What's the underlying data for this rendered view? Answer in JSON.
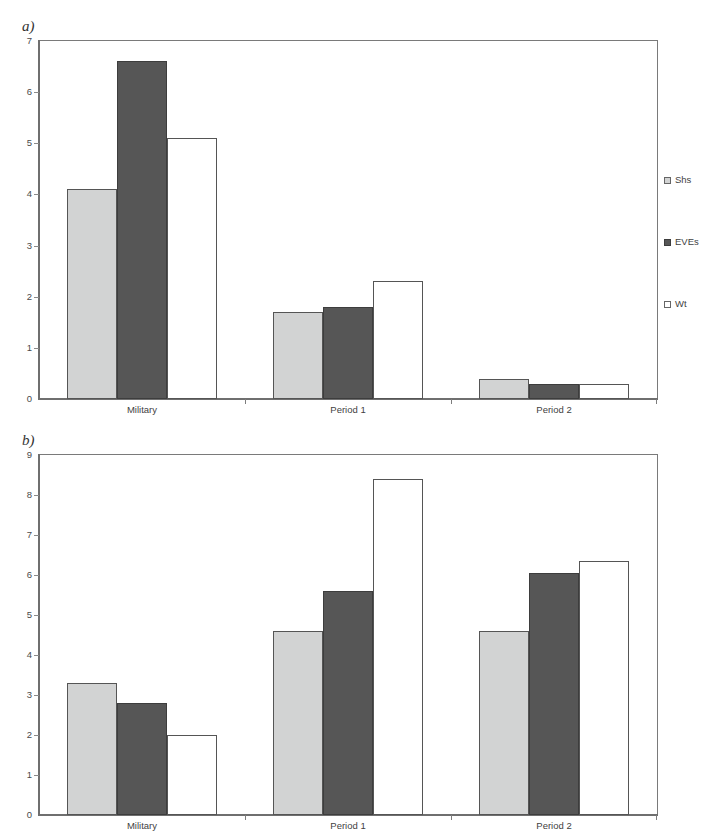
{
  "figure": {
    "background": "#ffffff",
    "width": 722,
    "height": 838
  },
  "panels": [
    {
      "id": "a",
      "label": "a)",
      "legend_position": "right"
    },
    {
      "id": "b",
      "label": "b)",
      "legend_position": "right"
    }
  ],
  "colors": {
    "shs_fill": "#d2d3d3",
    "eves_fill": "#565656",
    "wt_fill": "#ffffff",
    "bar_border": "#555555",
    "axis": "#6f6f6f",
    "text": "#3f3f3f"
  },
  "legend": {
    "items": [
      {
        "label": "Shs",
        "swatch": "shs"
      },
      {
        "label": "EVEs",
        "swatch": "eves"
      },
      {
        "label": "Wt",
        "swatch": "wt"
      }
    ]
  },
  "chart_data": [
    {
      "panel": "a",
      "type": "bar",
      "title": "",
      "xlabel": "",
      "ylabel": "",
      "categories": [
        "Military",
        "Period 1",
        "Period 2"
      ],
      "series": [
        {
          "name": "Shs",
          "values": [
            4.1,
            1.7,
            0.4
          ]
        },
        {
          "name": "EVEs",
          "values": [
            6.6,
            1.8,
            0.3
          ]
        },
        {
          "name": "Wt",
          "values": [
            5.1,
            2.3,
            0.3
          ]
        }
      ],
      "ylim": [
        0,
        7
      ],
      "yticks": [
        0,
        1,
        2,
        3,
        4,
        5,
        6,
        7
      ],
      "ytick_labels": [
        "0",
        "1",
        "2",
        "3",
        "4",
        "5",
        "6",
        "7"
      ],
      "grid": false,
      "legend_position": "right"
    },
    {
      "panel": "b",
      "type": "bar",
      "title": "",
      "xlabel": "",
      "ylabel": "",
      "categories": [
        "Military",
        "Period 1",
        "Period 2"
      ],
      "series": [
        {
          "name": "Shs",
          "values": [
            3.3,
            4.6,
            4.6
          ]
        },
        {
          "name": "EVEs",
          "values": [
            2.8,
            5.6,
            6.05
          ]
        },
        {
          "name": "Wt",
          "values": [
            2.0,
            8.4,
            6.35
          ]
        }
      ],
      "ylim": [
        0,
        9
      ],
      "yticks": [
        0,
        1,
        2,
        3,
        4,
        5,
        6,
        7,
        8,
        9
      ],
      "ytick_labels": [
        "0",
        "1",
        "2",
        "3",
        "4",
        "5",
        "6",
        "7",
        "8",
        "9"
      ],
      "grid": false,
      "legend_position": "right"
    }
  ]
}
